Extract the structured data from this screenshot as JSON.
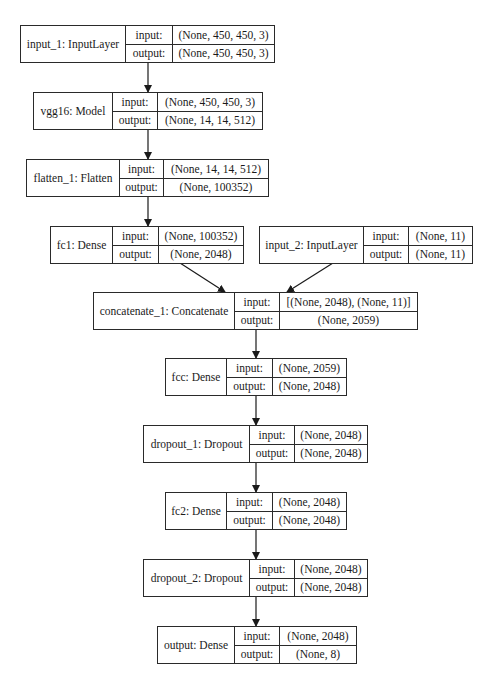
{
  "diagram": {
    "type": "keras-model-plot",
    "io_labels": {
      "input": "input:",
      "output": "output:"
    },
    "nodes": [
      {
        "id": "input_1",
        "name": "input_1: InputLayer",
        "input": "(None, 450, 450, 3)",
        "output": "(None, 450, 450, 3)"
      },
      {
        "id": "vgg16",
        "name": "vgg16: Model",
        "input": "(None, 450, 450, 3)",
        "output": "(None, 14, 14, 512)"
      },
      {
        "id": "flatten_1",
        "name": "flatten_1: Flatten",
        "input": "(None, 14, 14, 512)",
        "output": "(None, 100352)"
      },
      {
        "id": "fc1",
        "name": "fc1: Dense",
        "input": "(None, 100352)",
        "output": "(None, 2048)"
      },
      {
        "id": "input_2",
        "name": "input_2: InputLayer",
        "input": "(None, 11)",
        "output": "(None, 11)"
      },
      {
        "id": "concatenate_1",
        "name": "concatenate_1: Concatenate",
        "input": "[(None, 2048), (None, 11)]",
        "output": "(None, 2059)"
      },
      {
        "id": "fcc",
        "name": "fcc: Dense",
        "input": "(None, 2059)",
        "output": "(None, 2048)"
      },
      {
        "id": "dropout_1",
        "name": "dropout_1: Dropout",
        "input": "(None, 2048)",
        "output": "(None, 2048)"
      },
      {
        "id": "fc2",
        "name": "fc2: Dense",
        "input": "(None, 2048)",
        "output": "(None, 2048)"
      },
      {
        "id": "dropout_2",
        "name": "dropout_2: Dropout",
        "input": "(None, 2048)",
        "output": "(None, 2048)"
      },
      {
        "id": "output",
        "name": "output: Dense",
        "input": "(None, 2048)",
        "output": "(None, 8)"
      }
    ],
    "edges": [
      [
        "input_1",
        "vgg16"
      ],
      [
        "vgg16",
        "flatten_1"
      ],
      [
        "flatten_1",
        "fc1"
      ],
      [
        "fc1",
        "concatenate_1"
      ],
      [
        "input_2",
        "concatenate_1"
      ],
      [
        "concatenate_1",
        "fcc"
      ],
      [
        "fcc",
        "dropout_1"
      ],
      [
        "dropout_1",
        "fc2"
      ],
      [
        "fc2",
        "dropout_2"
      ],
      [
        "dropout_2",
        "output"
      ]
    ]
  }
}
